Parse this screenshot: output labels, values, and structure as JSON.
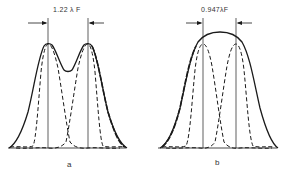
{
  "panels": [
    {
      "id": "a",
      "label": "a",
      "separation_label": "1.22 λ F",
      "description": "Two Airy patterns resolved at Rayleigh criterion, summed intensity shows central dip"
    },
    {
      "id": "b",
      "label": "b",
      "separation_label": "0.947λF",
      "description": "Two Airy patterns at Sparrow limit, summed intensity has flat top"
    }
  ],
  "colors": {
    "line": "#1a1a1a",
    "background": "#ffffff"
  }
}
